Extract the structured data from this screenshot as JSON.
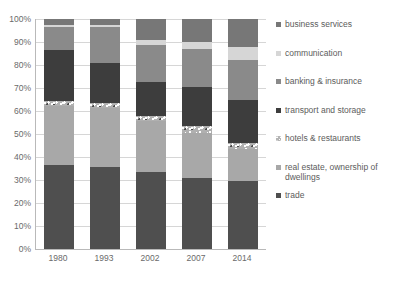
{
  "chart_data": {
    "type": "bar",
    "subtype": "stacked-100-percent",
    "title": "",
    "xlabel": "",
    "ylabel": "",
    "categories": [
      "1980",
      "1993",
      "2002",
      "2007",
      "2014"
    ],
    "ylim": [
      0,
      100
    ],
    "ytick_labels": [
      "0%",
      "10%",
      "20%",
      "30%",
      "40%",
      "50%",
      "60%",
      "70%",
      "80%",
      "90%",
      "100%"
    ],
    "ytick_values": [
      0,
      10,
      20,
      30,
      40,
      50,
      60,
      70,
      80,
      90,
      100
    ],
    "grid": true,
    "legend_position": "right",
    "series": [
      {
        "name": "trade",
        "color": "#4f4f4f",
        "values": [
          36.5,
          35.5,
          33.5,
          31.0,
          29.5
        ]
      },
      {
        "name": "real estate, ownership of dwellings",
        "color": "#a8a8a8",
        "values": [
          25.5,
          26.0,
          22.0,
          19.5,
          14.0
        ]
      },
      {
        "name": "hotels & restaurants",
        "color": "#b0b0b0",
        "values": [
          2.5,
          2.0,
          2.5,
          3.0,
          2.5
        ]
      },
      {
        "name": "transport and storage",
        "color": "#3d3d3d",
        "values": [
          22.0,
          17.5,
          14.5,
          17.0,
          19.0
        ]
      },
      {
        "name": "banking & insurance",
        "color": "#8a8a8a",
        "values": [
          10.0,
          15.5,
          16.0,
          16.5,
          17.0
        ]
      },
      {
        "name": "communication",
        "color": "#d6d6d6",
        "values": [
          1.0,
          1.0,
          2.5,
          3.0,
          6.0
        ]
      },
      {
        "name": "business services",
        "color": "#777777",
        "values": [
          2.5,
          2.5,
          9.0,
          10.0,
          12.0
        ]
      }
    ]
  },
  "legend": {
    "entries": [
      {
        "label": "business services",
        "color": "#777777",
        "swatch": "solid"
      },
      {
        "label": "communication",
        "color": "#d6d6d6",
        "swatch": "solid"
      },
      {
        "label": "banking & insurance",
        "color": "#8a8a8a",
        "swatch": "solid"
      },
      {
        "label": "transport and storage",
        "color": "#3d3d3d",
        "swatch": "solid"
      },
      {
        "label": "hotels & restaurants",
        "color": "#b0b0b0",
        "swatch": "pattern"
      },
      {
        "label": "real estate, ownership of dwellings",
        "color": "#a8a8a8",
        "swatch": "solid"
      },
      {
        "label": "trade",
        "color": "#4f4f4f",
        "swatch": "solid"
      }
    ]
  }
}
